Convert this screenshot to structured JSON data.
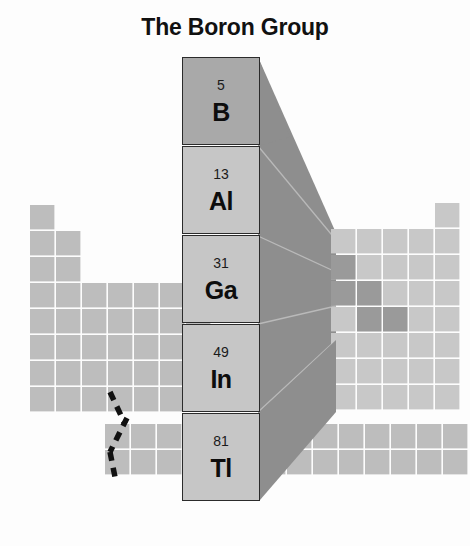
{
  "title": "The Boron Group",
  "colors": {
    "title_text": "#111111",
    "cell_fill": "#bdbdbd",
    "cell_fill_light": "#cfcfcf",
    "cell_fill_metalloid": "#9a9a9a",
    "grid_line": "#ffffff",
    "cone_fill": "#8e8e8e",
    "cone_line": "#b5b5b5",
    "box_border": "#2b2b2b",
    "box_fill": "#c6c6c6",
    "box_fill_boron": "#a9a9a9",
    "shadow_fill": "#8e8e8e",
    "dashed_line": "#111111",
    "background": "#fdfdfd"
  },
  "elements": [
    {
      "number": "5",
      "symbol": "B",
      "name": "boron",
      "highlight": true
    },
    {
      "number": "13",
      "symbol": "Al",
      "name": "aluminium",
      "highlight": false
    },
    {
      "number": "31",
      "symbol": "Ga",
      "name": "gallium",
      "highlight": false
    },
    {
      "number": "49",
      "symbol": "In",
      "name": "indium",
      "highlight": false
    },
    {
      "number": "81",
      "symbol": "Tl",
      "name": "thallium",
      "highlight": false
    }
  ],
  "periodic_table": {
    "cell_size": 24.4,
    "gap": 1.4,
    "left_block": {
      "origin_x": 30,
      "origin_y": 205,
      "rows": [
        {
          "row": 1,
          "cols": 1
        },
        {
          "row": 2,
          "cols": 2
        },
        {
          "row": 3,
          "cols": 2
        },
        {
          "row": 4,
          "cols": 7
        },
        {
          "row": 5,
          "cols": 7
        },
        {
          "row": 6,
          "cols": 7
        },
        {
          "row": 7,
          "cols": 7
        }
      ]
    },
    "right_block": {
      "origin_x": 331,
      "origin_y": 229,
      "rows": [
        {
          "row": 2,
          "cols": 5
        },
        {
          "row": 3,
          "cols": 5
        },
        {
          "row": 4,
          "cols": 5
        },
        {
          "row": 5,
          "cols": 5
        },
        {
          "row": 6,
          "cols": 5
        },
        {
          "row": 7,
          "cols": 5
        }
      ],
      "noble_column_x": 431,
      "noble_rows": 7
    },
    "metalloid_cells": [
      {
        "x": 331,
        "y": 255
      },
      {
        "x": 331,
        "y": 281
      },
      {
        "x": 357,
        "y": 281
      },
      {
        "x": 357,
        "y": 307
      },
      {
        "x": 383,
        "y": 307
      }
    ],
    "bottom_block": {
      "origin_x": 105,
      "origin_y": 424,
      "rows": 2,
      "cols": 14
    },
    "dashed_marker_label": "group-13-connector"
  },
  "icons": {
    "cone": "perspective-cone",
    "shadow": "drop-shadow-wedge",
    "dashed": "dashed-connector-line"
  }
}
